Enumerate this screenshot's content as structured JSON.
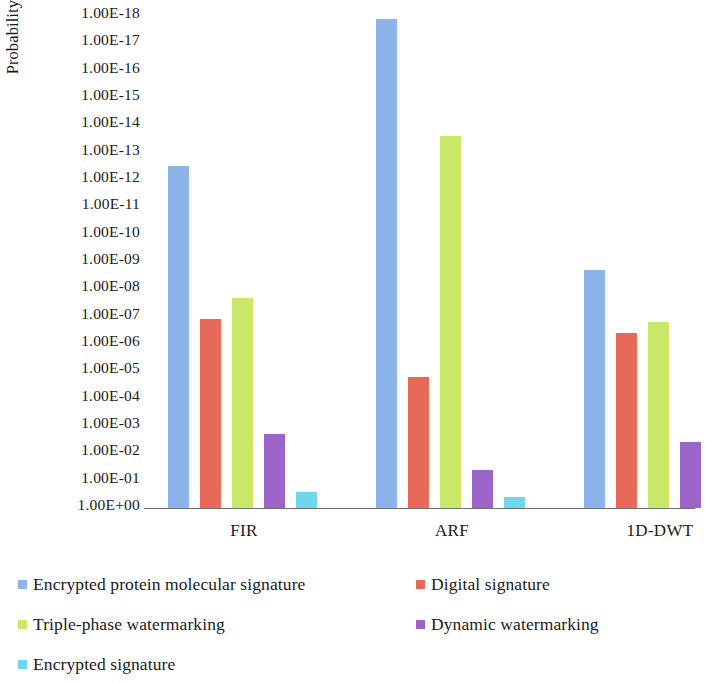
{
  "chart_data": {
    "type": "bar",
    "title": "",
    "subtitle": "",
    "xlabel": "",
    "ylabel": "Probability of coincidence",
    "categories": [
      "FIR",
      "ARF",
      "1D-DWT"
    ],
    "grid": false,
    "legend_position": "bottom-left",
    "y_axis": {
      "scale": "log",
      "inverted": true,
      "note": "1.00E-18 at top, 1.00E+00 at bottom",
      "ticks": [
        "1.00E-18",
        "1.00E-17",
        "1.00E-16",
        "1.00E-15",
        "1.00E-14",
        "1.00E-13",
        "1.00E-12",
        "1.00E-11",
        "1.00E-10",
        "1.00E-09",
        "1.00E-08",
        "1.00E-07",
        "1.00E-06",
        "1.00E-05",
        "1.00E-04",
        "1.00E-03",
        "1.00E-02",
        "1.00E-01",
        "1.00E+00"
      ],
      "ylim": [
        1e-18,
        1
      ]
    },
    "series": [
      {
        "name": "Encrypted protein molecular signature",
        "color": "#8CB4E8",
        "values": [
          3.2e-13,
          1.3e-18,
          2e-09
        ],
        "exponents": [
          -12.5,
          -17.9,
          -8.7
        ]
      },
      {
        "name": "Digital signature",
        "color": "#E8695A",
        "values": [
          1.3e-07,
          1.6e-05,
          4e-07
        ],
        "exponents": [
          -6.9,
          -4.8,
          -6.4
        ]
      },
      {
        "name": "Triple-phase watermarking",
        "color": "#C9E86A",
        "values": [
          2e-08,
          2.5e-14,
          1.6e-07
        ],
        "exponents": [
          -7.7,
          -13.6,
          -6.8
        ]
      },
      {
        "name": "Dynamic watermarking",
        "color": "#9B64C8",
        "values": [
          0.002,
          0.04,
          0.004
        ],
        "exponents": [
          -2.7,
          -1.4,
          -2.4
        ]
      },
      {
        "name": "Encrypted signature",
        "color": "#6ED7EC",
        "values": [
          0.25,
          0.4,
          null
        ],
        "exponents": [
          -0.6,
          -0.4,
          null
        ]
      }
    ]
  },
  "legend": {
    "items": [
      {
        "label": "Encrypted protein molecular signature",
        "color": "#8CB4E8"
      },
      {
        "label": "Digital signature",
        "color": "#E8695A"
      },
      {
        "label": "Triple-phase watermarking",
        "color": "#C9E86A"
      },
      {
        "label": "Dynamic watermarking",
        "color": "#9B64C8"
      },
      {
        "label": "Encrypted signature",
        "color": "#6ED7EC"
      }
    ]
  }
}
